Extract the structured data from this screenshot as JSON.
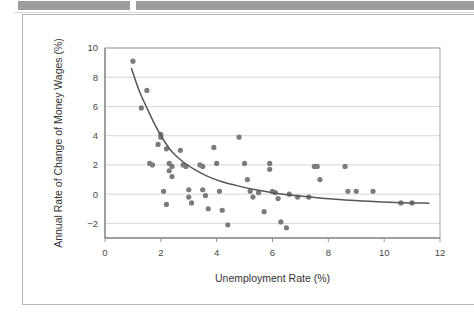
{
  "scan_header": {
    "bar_left_name": "header-redaction-bar-left",
    "bar_right_name": "header-redaction-bar-right"
  },
  "colors": {
    "point": "#7b7b7b",
    "curve": "#55575a",
    "gridline": "#c6c6c6",
    "frame": "#9a9a9a",
    "axis_text": "#4a4a4a",
    "title_text": "#333333",
    "scan_bar": "#9d9d9d",
    "card_border": "#b9b9b9"
  },
  "chart_data": {
    "type": "scatter",
    "title": "",
    "xlabel": "Unemployment Rate (%)",
    "ylabel": "Annual Rate of Change of Money Wages (%)",
    "xlim": [
      0,
      12
    ],
    "ylim": [
      -3,
      10
    ],
    "xticks": [
      0,
      2,
      4,
      6,
      8,
      10,
      12
    ],
    "yticks": [
      -2,
      0,
      2,
      4,
      6,
      8,
      10
    ],
    "xtick_labels": [
      "0",
      "2",
      "4",
      "6",
      "8",
      "10",
      "12"
    ],
    "ytick_labels": [
      "−2",
      "0",
      "2",
      "4",
      "6",
      "8",
      "10"
    ],
    "grid": "horizontal",
    "legend": "none",
    "series": [
      {
        "name": "Wage inflation vs unemployment observations",
        "marker": "filled-circle",
        "points": [
          [
            1.0,
            9.1
          ],
          [
            1.5,
            7.1
          ],
          [
            1.3,
            5.9
          ],
          [
            1.6,
            2.1
          ],
          [
            1.7,
            2.0
          ],
          [
            2.0,
            4.1
          ],
          [
            2.0,
            3.9
          ],
          [
            1.9,
            3.4
          ],
          [
            2.2,
            3.1
          ],
          [
            2.3,
            2.1
          ],
          [
            2.4,
            1.9
          ],
          [
            2.3,
            1.6
          ],
          [
            2.4,
            1.2
          ],
          [
            2.1,
            0.2
          ],
          [
            2.2,
            -0.7
          ],
          [
            2.7,
            3.0
          ],
          [
            2.8,
            2.0
          ],
          [
            2.9,
            1.9
          ],
          [
            3.0,
            0.3
          ],
          [
            3.0,
            -0.2
          ],
          [
            3.1,
            -0.6
          ],
          [
            3.4,
            2.0
          ],
          [
            3.5,
            1.9
          ],
          [
            3.5,
            0.3
          ],
          [
            3.6,
            -0.1
          ],
          [
            3.7,
            -1.0
          ],
          [
            3.9,
            3.2
          ],
          [
            4.0,
            2.1
          ],
          [
            4.1,
            0.2
          ],
          [
            4.2,
            -1.1
          ],
          [
            4.4,
            -2.1
          ],
          [
            4.8,
            3.9
          ],
          [
            5.0,
            2.1
          ],
          [
            5.1,
            1.0
          ],
          [
            5.2,
            0.2
          ],
          [
            5.3,
            -0.2
          ],
          [
            5.5,
            0.1
          ],
          [
            5.7,
            -1.2
          ],
          [
            5.9,
            2.1
          ],
          [
            5.9,
            1.7
          ],
          [
            6.0,
            0.2
          ],
          [
            6.1,
            0.1
          ],
          [
            6.2,
            -0.3
          ],
          [
            6.3,
            -1.9
          ],
          [
            6.5,
            -2.3
          ],
          [
            6.6,
            0.0
          ],
          [
            6.9,
            -0.2
          ],
          [
            7.3,
            -0.2
          ],
          [
            7.5,
            1.9
          ],
          [
            7.6,
            1.9
          ],
          [
            7.7,
            1.0
          ],
          [
            8.6,
            1.9
          ],
          [
            8.7,
            0.2
          ],
          [
            9.0,
            0.2
          ],
          [
            9.6,
            0.2
          ],
          [
            10.6,
            -0.6
          ],
          [
            11.0,
            -0.6
          ]
        ]
      }
    ],
    "fit_curve": {
      "name": "Fitted Phillips curve",
      "points": [
        [
          0.95,
          8.6
        ],
        [
          1.2,
          7.2
        ],
        [
          1.5,
          5.9
        ],
        [
          1.8,
          4.7
        ],
        [
          2.1,
          3.7
        ],
        [
          2.4,
          2.9
        ],
        [
          2.8,
          2.2
        ],
        [
          3.2,
          1.7
        ],
        [
          3.7,
          1.2
        ],
        [
          4.2,
          0.85
        ],
        [
          4.8,
          0.55
        ],
        [
          5.4,
          0.3
        ],
        [
          6.0,
          0.1
        ],
        [
          6.8,
          -0.1
        ],
        [
          7.6,
          -0.25
        ],
        [
          8.6,
          -0.4
        ],
        [
          9.6,
          -0.5
        ],
        [
          10.6,
          -0.58
        ],
        [
          11.6,
          -0.62
        ]
      ]
    }
  }
}
